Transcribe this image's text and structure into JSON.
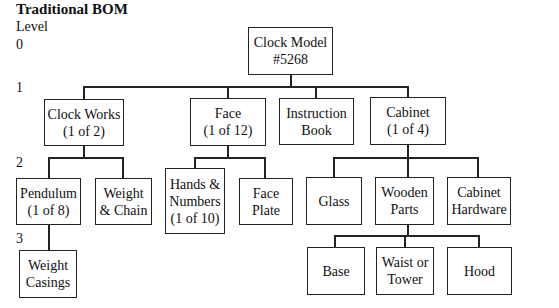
{
  "title": "Traditional BOM",
  "level_label": "Level",
  "levels": [
    "0",
    "1",
    "2",
    "3"
  ],
  "nodes": {
    "root": "Clock Model\n#5268",
    "clock_works": "Clock Works\n(1 of 2)",
    "face": "Face\n(1 of 12)",
    "instruction_book": "Instruction\nBook",
    "cabinet": "Cabinet\n(1 of 4)",
    "pendulum": "Pendulum\n(1 of 8)",
    "weight_chain": "Weight\n& Chain",
    "hands_numbers": "Hands &\nNumbers\n(1 of 10)",
    "face_plate": "Face\nPlate",
    "glass": "Glass",
    "wooden_parts": "Wooden\nParts",
    "cabinet_hardware": "Cabinet\nHardware",
    "weight_casings": "Weight\nCasings",
    "base": "Base",
    "waist_tower": "Waist or\nTower",
    "hood": "Hood"
  }
}
